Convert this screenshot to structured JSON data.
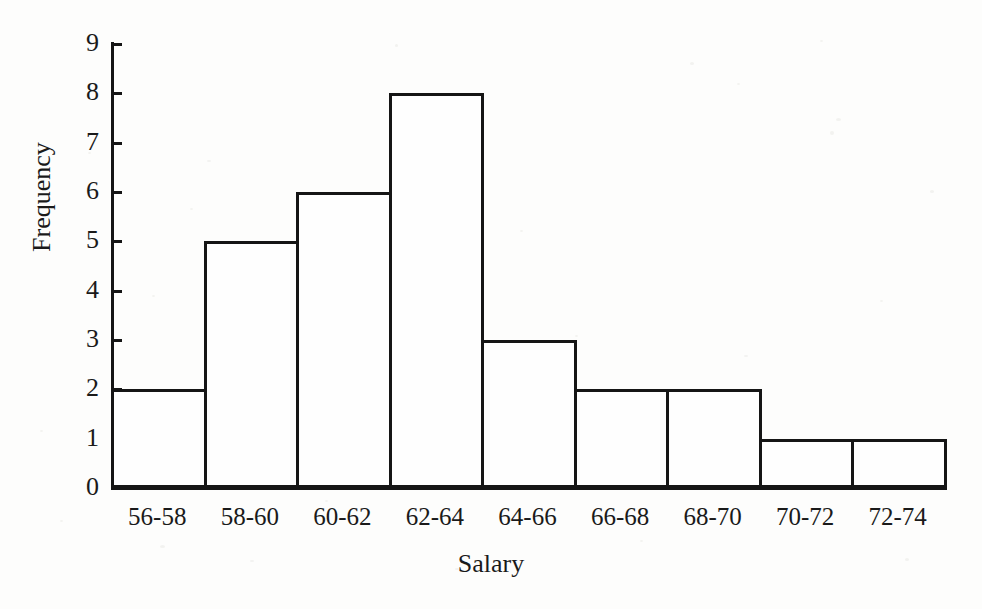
{
  "chart_data": {
    "type": "bar",
    "title": "",
    "xlabel": "Salary",
    "ylabel": "Frequency",
    "categories": [
      "56-58",
      "58-60",
      "60-62",
      "62-64",
      "64-66",
      "66-68",
      "68-70",
      "70-72",
      "72-74"
    ],
    "values": [
      2,
      5,
      6,
      8,
      3,
      2,
      2,
      1,
      1
    ],
    "yticks": [
      "0",
      "1",
      "2",
      "3",
      "4",
      "5",
      "6",
      "7",
      "8",
      "9"
    ],
    "ylim": [
      0,
      9
    ],
    "grid": false,
    "legend": false,
    "bar_fill_color": "#fefefe",
    "bar_edge_color": "#151515",
    "axis_color": "#151515",
    "background_color": "#fdfdfc"
  }
}
